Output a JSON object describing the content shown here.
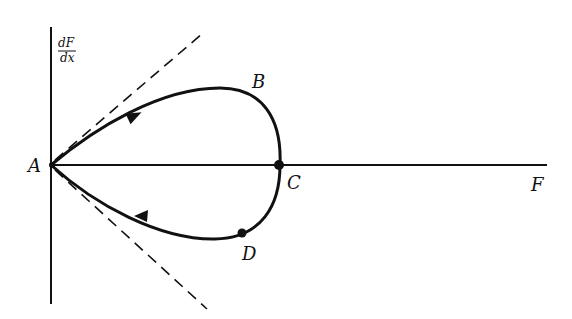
{
  "diagram": {
    "type": "phase-plane",
    "axes": {
      "y_label_num": "dF",
      "y_label_den": "dx",
      "x_label": "F"
    },
    "points": {
      "A": "A",
      "B": "B",
      "C": "C",
      "D": "D"
    },
    "colors": {
      "ink": "#111111",
      "background": "#ffffff"
    }
  }
}
